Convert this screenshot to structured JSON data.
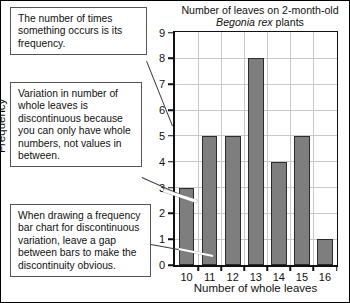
{
  "chart_data": {
    "type": "bar",
    "title": "Number of leaves on 2-month-old Begonia rex plants",
    "title_line1": "Number of leaves on 2-month-old",
    "title_species": "Begonia rex",
    "title_line2_suffix": " plants",
    "xlabel": "Number of whole leaves",
    "ylabel": "Frequency",
    "categories": [
      "10",
      "11",
      "12",
      "13",
      "14",
      "15",
      "16"
    ],
    "values": [
      3,
      5,
      5,
      8,
      4,
      5,
      1
    ],
    "ylim": [
      0,
      9
    ],
    "yticks": [
      "0",
      "1",
      "2",
      "3",
      "4",
      "5",
      "6",
      "7",
      "8",
      "9"
    ],
    "grid": true,
    "legend": "none",
    "bar_color": "#7e7e7e",
    "bar_border_color": "#2b2b2b",
    "gridline_color": "#c9c9c9",
    "axis_color": "#111111"
  },
  "annotations": [
    {
      "id": "frequency-definition",
      "text": "The number of times something occurs is its frequency."
    },
    {
      "id": "discontinuous-variation",
      "text": "Variation in number of whole leaves is discontinuous because you can only have whole numbers, not values in between."
    },
    {
      "id": "gap-between-bars",
      "text": "When drawing a frequency bar chart for discontinuous variation, leave a gap between bars to make the discontinuity obvious."
    }
  ]
}
